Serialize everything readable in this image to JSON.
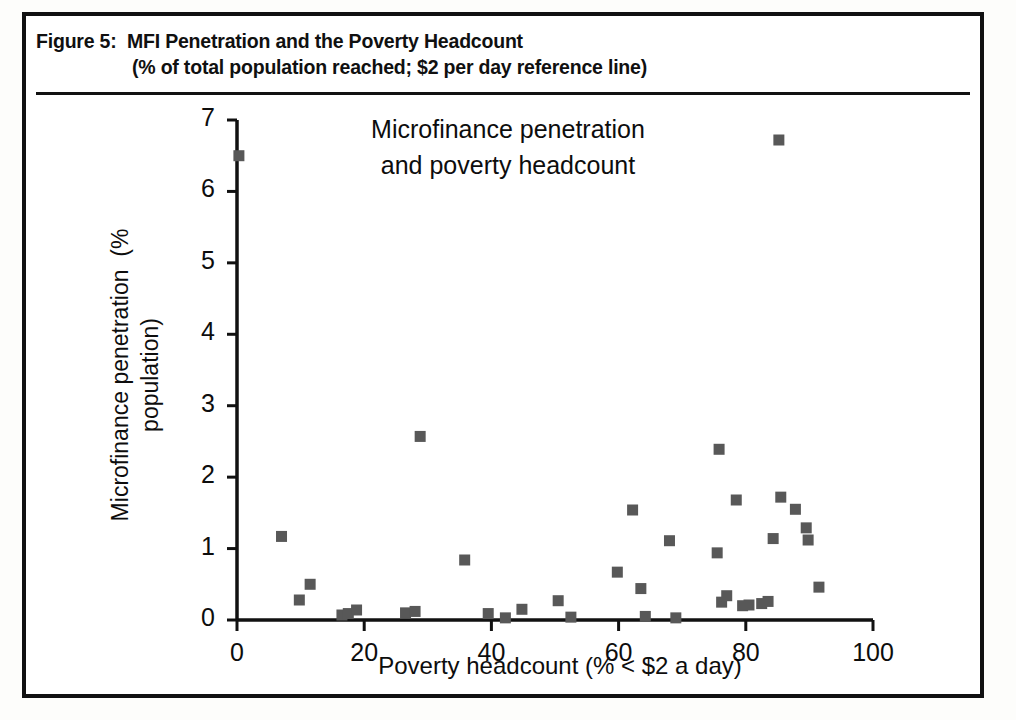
{
  "figure": {
    "caption_line_1": "Figure 5:  MFI Penetration and the Poverty Headcount",
    "caption_line_2": "(% of total population reached; $2 per day reference line)"
  },
  "chart_data": {
    "type": "scatter",
    "title_line_1": "Microfinance penetration",
    "title_line_2": "and poverty headcount",
    "title": "Microfinance penetration and poverty headcount",
    "xlabel": "Poverty headcount (% < $2 a day)",
    "ylabel_line_1": "Microfinance penetration  (%",
    "ylabel_line_2": "population)",
    "ylabel": "Microfinance penetration (% population)",
    "xlim": [
      0,
      100
    ],
    "ylim": [
      0,
      7
    ],
    "xticks": [
      0,
      20,
      40,
      60,
      80,
      100
    ],
    "yticks": [
      0,
      1,
      2,
      3,
      4,
      5,
      6,
      7
    ],
    "xtick_labels": [
      "0",
      "20",
      "40",
      "60",
      "80",
      "100"
    ],
    "ytick_labels": [
      "0",
      "1",
      "2",
      "3",
      "4",
      "5",
      "6",
      "7"
    ],
    "grid": false,
    "legend": "none",
    "marker": "square",
    "marker_color": "#585858",
    "axis_color": "#111111",
    "points": [
      {
        "x": 0.3,
        "y": 6.5
      },
      {
        "x": 7.0,
        "y": 1.17
      },
      {
        "x": 9.8,
        "y": 0.28
      },
      {
        "x": 11.5,
        "y": 0.5
      },
      {
        "x": 16.5,
        "y": 0.07
      },
      {
        "x": 17.5,
        "y": 0.09
      },
      {
        "x": 18.8,
        "y": 0.14
      },
      {
        "x": 26.5,
        "y": 0.1
      },
      {
        "x": 28.0,
        "y": 0.12
      },
      {
        "x": 28.8,
        "y": 2.57
      },
      {
        "x": 35.8,
        "y": 0.84
      },
      {
        "x": 39.5,
        "y": 0.09
      },
      {
        "x": 42.2,
        "y": 0.03
      },
      {
        "x": 44.8,
        "y": 0.15
      },
      {
        "x": 50.5,
        "y": 0.27
      },
      {
        "x": 52.5,
        "y": 0.04
      },
      {
        "x": 59.8,
        "y": 0.67
      },
      {
        "x": 62.2,
        "y": 1.54
      },
      {
        "x": 63.5,
        "y": 0.44
      },
      {
        "x": 64.2,
        "y": 0.05
      },
      {
        "x": 68.0,
        "y": 1.11
      },
      {
        "x": 69.0,
        "y": 0.03
      },
      {
        "x": 75.8,
        "y": 2.39
      },
      {
        "x": 75.5,
        "y": 0.94
      },
      {
        "x": 76.2,
        "y": 0.25
      },
      {
        "x": 77.0,
        "y": 0.34
      },
      {
        "x": 78.5,
        "y": 1.68
      },
      {
        "x": 79.5,
        "y": 0.2
      },
      {
        "x": 80.5,
        "y": 0.21
      },
      {
        "x": 82.5,
        "y": 0.23
      },
      {
        "x": 83.5,
        "y": 0.26
      },
      {
        "x": 84.3,
        "y": 1.14
      },
      {
        "x": 85.2,
        "y": 6.72
      },
      {
        "x": 85.5,
        "y": 1.72
      },
      {
        "x": 87.8,
        "y": 1.55
      },
      {
        "x": 89.5,
        "y": 1.29
      },
      {
        "x": 89.8,
        "y": 1.12
      },
      {
        "x": 91.5,
        "y": 0.46
      }
    ]
  }
}
